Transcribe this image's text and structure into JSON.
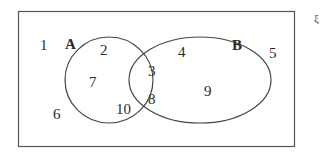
{
  "diagram": {
    "type": "venn",
    "universal_symbol": "ξ",
    "sets": [
      {
        "label": "A",
        "elements": [
          "2",
          "7",
          "10",
          "3",
          "8"
        ]
      },
      {
        "label": "B",
        "elements": [
          "4",
          "9",
          "3",
          "8"
        ]
      }
    ],
    "regions": {
      "outside": [
        "1",
        "6",
        "5"
      ],
      "A_only": [
        "2",
        "7",
        "10"
      ],
      "A_and_B": [
        "3",
        "8"
      ],
      "B_only": [
        "4",
        "9"
      ]
    },
    "numbers": {
      "n1": "1",
      "n2": "2",
      "n3": "3",
      "n4": "4",
      "n5": "5",
      "n6": "6",
      "n7": "7",
      "n8": "8",
      "n9": "9",
      "n10": "10"
    },
    "colors": {
      "stroke": "#4a4a4a",
      "text": "#2a2a2a",
      "background": "#ffffff"
    }
  }
}
